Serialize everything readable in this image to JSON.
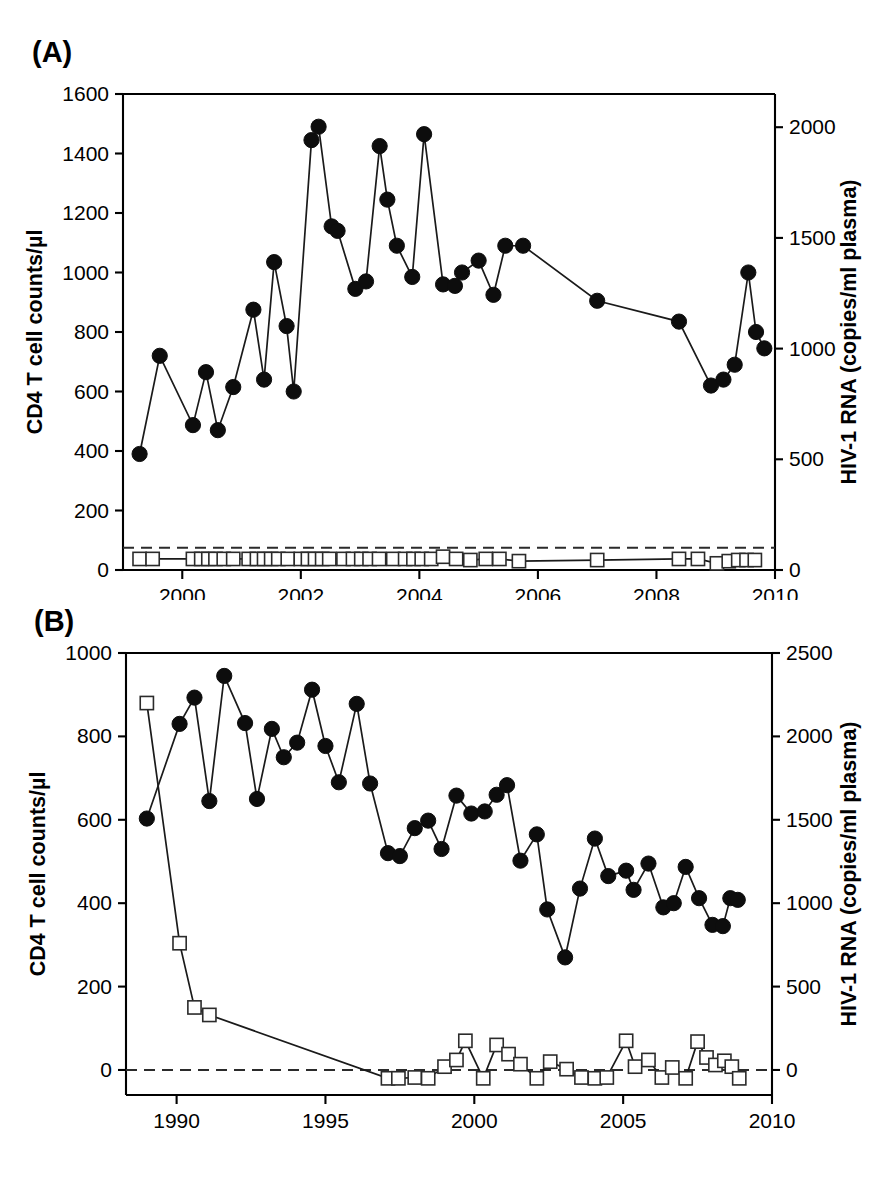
{
  "figure": {
    "panels": [
      {
        "letter": "(A)",
        "left_axis_title": "CD4 T cell counts/µl",
        "right_axis_title": "HIV-1 RNA (copies/ml plasma)",
        "left_ticks": [
          0,
          200,
          400,
          600,
          800,
          1000,
          1200,
          1400,
          1600
        ],
        "right_ticks": [
          0,
          500,
          1000,
          1500,
          2000
        ],
        "x_ticks": [
          2000,
          2002,
          2004,
          2006,
          2008,
          2010
        ],
        "x_range": [
          1999.0,
          2010.0
        ],
        "left_range": [
          0,
          1600
        ],
        "right_range": [
          0,
          2150
        ],
        "detection_limit": 100
      },
      {
        "letter": "(B)",
        "left_axis_title": "CD4 T cell counts/µl",
        "right_axis_title": "HIV-1 RNA (copies/ml plasma)",
        "left_ticks": [
          0,
          200,
          400,
          600,
          800,
          1000
        ],
        "right_ticks": [
          0,
          500,
          1000,
          1500,
          2000,
          2500
        ],
        "x_ticks": [
          1990,
          1995,
          2000,
          2005,
          2010
        ],
        "x_range": [
          1988.3,
          2010.0
        ],
        "left_range": [
          -60,
          1000
        ],
        "right_range": [
          -150,
          2500
        ],
        "detection_limit": 0
      }
    ]
  },
  "chart_data": [
    {
      "type": "line",
      "title": "(A)",
      "xlabel": "",
      "ylabel": "CD4 T cell counts/µl",
      "y2label": "HIV-1 RNA (copies/ml plasma)",
      "xlim": [
        1999.0,
        2010.0
      ],
      "ylim": [
        0,
        1600
      ],
      "y2lim": [
        0,
        2150
      ],
      "grid": false,
      "legend": "none",
      "annotations": [
        "dashed line marks HIV-1 RNA detection limit of 50-100 copies/ml"
      ],
      "series": [
        {
          "name": "CD4 T cell counts",
          "axis": "left",
          "marker": "filled-circle",
          "x": [
            1999.28,
            1999.62,
            2000.18,
            2000.4,
            2000.6,
            2000.86,
            2001.2,
            2001.38,
            2001.55,
            2001.76,
            2001.88,
            2002.18,
            2002.3,
            2002.52,
            2002.62,
            2002.92,
            2003.1,
            2003.33,
            2003.46,
            2003.62,
            2003.88,
            2004.08,
            2004.4,
            2004.6,
            2004.72,
            2005.0,
            2005.25,
            2005.45,
            2005.75,
            2007.0,
            2008.38,
            2008.92,
            2009.13,
            2009.32,
            2009.55,
            2009.68,
            2009.82
          ],
          "values": [
            390,
            720,
            487,
            665,
            470,
            615,
            875,
            640,
            1035,
            820,
            600,
            1445,
            1490,
            1155,
            1140,
            945,
            970,
            1425,
            1245,
            1090,
            985,
            1465,
            960,
            955,
            1000,
            1040,
            925,
            1090,
            1090,
            905,
            835,
            620,
            640,
            690,
            1000,
            800,
            745
          ]
        },
        {
          "name": "HIV-1 RNA",
          "axis": "right",
          "marker": "open-square",
          "x": [
            1999.28,
            1999.5,
            2000.18,
            2000.32,
            2000.44,
            2000.56,
            2000.7,
            2000.86,
            2001.12,
            2001.26,
            2001.38,
            2001.5,
            2001.62,
            2001.78,
            2002.0,
            2002.12,
            2002.24,
            2002.36,
            2002.48,
            2002.72,
            2002.88,
            2003.02,
            2003.16,
            2003.32,
            2003.56,
            2003.76,
            2003.9,
            2004.04,
            2004.2,
            2004.4,
            2004.62,
            2004.86,
            2005.12,
            2005.35,
            2005.68,
            2007.0,
            2008.38,
            2008.7,
            2009.02,
            2009.22,
            2009.38,
            2009.52,
            2009.66
          ],
          "values": [
            50,
            50,
            50,
            50,
            50,
            50,
            50,
            50,
            50,
            50,
            50,
            50,
            50,
            50,
            50,
            50,
            50,
            50,
            50,
            50,
            50,
            50,
            50,
            50,
            50,
            50,
            50,
            50,
            50,
            60,
            50,
            45,
            50,
            50,
            40,
            45,
            50,
            50,
            30,
            40,
            45,
            45,
            45
          ]
        }
      ]
    },
    {
      "type": "line",
      "title": "(B)",
      "xlabel": "",
      "ylabel": "CD4 T cell counts/µl",
      "y2label": "HIV-1 RNA (copies/ml plasma)",
      "xlim": [
        1988.3,
        2010.0
      ],
      "ylim": [
        -60,
        1000
      ],
      "y2lim": [
        -150,
        2500
      ],
      "grid": false,
      "legend": "none",
      "annotations": [
        "dashed line at zero marks HIV-1 RNA detection limit"
      ],
      "series": [
        {
          "name": "CD4 T cell counts",
          "axis": "left",
          "marker": "filled-circle",
          "x": [
            1989.0,
            1990.1,
            1990.6,
            1991.1,
            1991.6,
            1992.3,
            1992.7,
            1993.2,
            1993.6,
            1994.05,
            1994.55,
            1995.0,
            1995.45,
            1996.05,
            1996.5,
            1997.1,
            1997.5,
            1998.0,
            1998.45,
            1998.9,
            1999.4,
            1999.9,
            2000.35,
            2000.75,
            2001.1,
            2001.55,
            2002.1,
            2002.45,
            2003.05,
            2003.55,
            2004.05,
            2004.5,
            2005.1,
            2005.35,
            2005.85,
            2006.35,
            2006.7,
            2007.1,
            2007.55,
            2008.0,
            2008.35,
            2008.6,
            2008.85
          ],
          "values": [
            603,
            830,
            893,
            645,
            945,
            832,
            650,
            818,
            750,
            785,
            912,
            777,
            690,
            878,
            687,
            520,
            513,
            580,
            598,
            530,
            658,
            615,
            620,
            660,
            683,
            502,
            565,
            385,
            270,
            435,
            555,
            465,
            478,
            432,
            495,
            390,
            400,
            487,
            412,
            348,
            345,
            412,
            408
          ]
        },
        {
          "name": "HIV-1 RNA",
          "axis": "right",
          "marker": "open-square",
          "x": [
            1989.0,
            1990.1,
            1990.6,
            1991.1,
            1997.1,
            1997.45,
            1998.0,
            1998.45,
            1999.0,
            1999.4,
            1999.7,
            2000.3,
            2000.75,
            2001.15,
            2001.55,
            2002.1,
            2002.55,
            2003.1,
            2003.6,
            2004.05,
            2004.45,
            2005.1,
            2005.4,
            2005.85,
            2006.3,
            2006.65,
            2007.1,
            2007.5,
            2007.8,
            2008.1,
            2008.4,
            2008.65,
            2008.9
          ],
          "values": [
            2200,
            760,
            375,
            330,
            -50,
            -50,
            -45,
            -50,
            20,
            60,
            175,
            -50,
            150,
            95,
            35,
            -50,
            50,
            5,
            -45,
            -50,
            -45,
            175,
            20,
            60,
            -45,
            15,
            -50,
            170,
            75,
            30,
            55,
            20,
            -50
          ]
        }
      ]
    }
  ]
}
